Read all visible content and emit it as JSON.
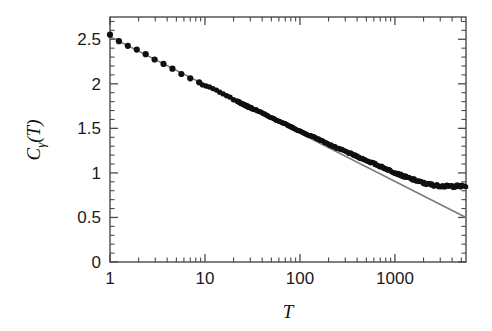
{
  "chart_data": {
    "type": "scatter",
    "title": "",
    "subtitle": "",
    "xlabel": "T",
    "ylabel": "C_gamma(T)",
    "ylabel_parts": {
      "base": "C",
      "subscript": "γ",
      "argument": "(T)"
    },
    "xscale": "log",
    "yscale": "linear",
    "xlim": [
      1,
      5600
    ],
    "ylim": [
      0,
      2.75
    ],
    "grid": false,
    "legend": null,
    "xticks": [
      1,
      10,
      100,
      1000
    ],
    "xtick_labels": [
      "1",
      "10",
      "100",
      "1000"
    ],
    "yticks": [
      0,
      0.5,
      1,
      1.5,
      2,
      2.5
    ],
    "ytick_labels": [
      "0",
      "0.5",
      "1",
      "1.5",
      "2",
      "2.5"
    ],
    "minor_ticks": "log-decade minor ticks on x; 0.1 interval minor ticks on y",
    "tick_direction": "in",
    "frame": "full box, all four spines",
    "series": [
      {
        "name": "data",
        "type": "scatter",
        "marker": "filled-circle",
        "color": "#101010",
        "x": [
          1,
          1.3,
          1.7,
          2.2,
          2.8,
          3.6,
          4.6,
          6,
          7.7,
          10,
          12.9,
          16.6,
          21.4,
          27.6,
          35.6,
          45.9,
          59.1,
          76.2,
          98.2,
          126.6,
          163.2,
          210.4,
          271.2,
          349.6,
          450.7,
          581,
          748.9,
          965.3,
          1244.3,
          1604,
          2067.5,
          2665.1,
          3435.5,
          4428.5,
          5500
        ],
        "y": [
          2.55,
          2.47,
          2.41,
          2.35,
          2.29,
          2.23,
          2.17,
          2.1,
          2.04,
          1.98,
          1.93,
          1.87,
          1.81,
          1.75,
          1.7,
          1.64,
          1.58,
          1.53,
          1.47,
          1.42,
          1.37,
          1.31,
          1.26,
          1.21,
          1.16,
          1.11,
          1.06,
          1.01,
          0.96,
          0.92,
          0.88,
          0.86,
          0.85,
          0.85,
          0.85
        ]
      },
      {
        "name": "linear fit",
        "type": "line",
        "color": "#7a7a7a",
        "x": [
          1,
          5600
        ],
        "y": [
          2.53,
          0.5
        ],
        "note": "straight line in log(T): slope approx -0.545 per decade"
      }
    ],
    "annotations": [
      "data follows the straight fit line from T=1 to T~1000, then saturates near C=0.85"
    ]
  },
  "axes": {
    "x_title": "T",
    "y_title_base": "C",
    "y_title_sub": "γ",
    "y_title_arg": "(T)"
  }
}
